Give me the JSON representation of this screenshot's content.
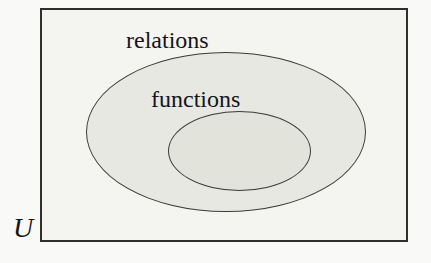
{
  "diagram": {
    "type": "euler-diagram",
    "universe": {
      "label": "U"
    },
    "sets": [
      {
        "label": "relations",
        "contains": "functions"
      },
      {
        "label": "functions",
        "subset_of": "relations"
      }
    ],
    "colors": {
      "page_background": "#f9f9f7",
      "universe_box_fill": "#f4f4f0",
      "universe_box_border": "#2f2f2d",
      "ellipse_stroke": "#3b3b39",
      "relations_ellipse_fill": "#e8e8e3",
      "functions_ellipse_fill": "#e2e3da",
      "text": "#151515"
    }
  }
}
